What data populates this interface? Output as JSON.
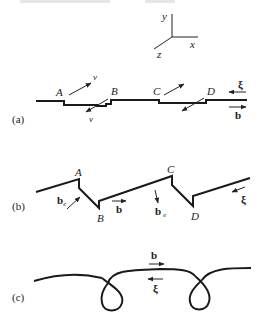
{
  "figure": {
    "axes": {
      "x_label": "x",
      "y_label": "y",
      "z_label": "z"
    },
    "panel_a": {
      "tag": "(a)",
      "points": [
        "A",
        "B",
        "C",
        "D"
      ],
      "velocity_label": "v",
      "xi_label": "ξ",
      "b_label": "b"
    },
    "panel_b": {
      "tag": "(b)",
      "points": [
        "A",
        "B",
        "C",
        "D"
      ],
      "b_label": "b",
      "be_label": "b",
      "be_sub": "e",
      "bs_label": "b",
      "bs_sub": "e",
      "xi_label": "ξ"
    },
    "panel_c": {
      "tag": "(c)",
      "b_label": "b",
      "xi_label": "ξ"
    },
    "colors": {
      "ink": "#1a1a1a",
      "background": "#ffffff"
    }
  }
}
